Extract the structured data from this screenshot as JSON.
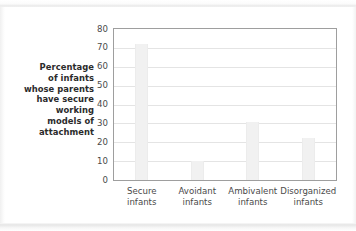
{
  "chart_data": {
    "type": "bar",
    "title": "",
    "subtitle": "",
    "xlabel": "",
    "ylabel": "Percentage of infants whose parents have secure working models of attachment",
    "ylabel_lines": [
      "Percentage",
      "of infants",
      "whose parents",
      "have secure",
      "working",
      "models of",
      "attachment"
    ],
    "categories": [
      "Secure infants",
      "Avoidant infants",
      "Ambivalent infants",
      "Disorganized infants"
    ],
    "category_lines": [
      [
        "Secure",
        "infants"
      ],
      [
        "Avoidant",
        "infants"
      ],
      [
        "Ambivalent",
        "infants"
      ],
      [
        "Disorganized",
        "infants"
      ]
    ],
    "values": [
      72,
      10,
      31,
      22
    ],
    "ylim": [
      0,
      80
    ],
    "ytick_values": [
      0,
      10,
      20,
      30,
      40,
      50,
      60,
      70,
      80
    ],
    "ytick_labels": [
      "0",
      "10",
      "20",
      "30",
      "40",
      "50",
      "60",
      "70",
      "80"
    ],
    "grid": true,
    "legend": false,
    "legend_position": "none",
    "colors": {
      "bar_fill": "#f1f1f1",
      "bar_edge": "#ececec",
      "gridline": "#e4e4e4",
      "plot_border": "#9e9e9e",
      "tick_text": "#4a4a4a",
      "axis_title_text": "#2b2b2b",
      "background": "#ffffff"
    }
  }
}
